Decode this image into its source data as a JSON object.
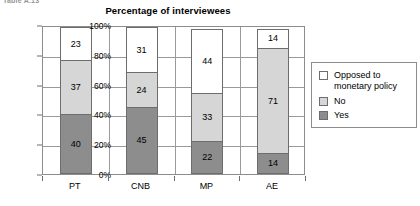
{
  "caption_fragment": "Table A.13",
  "chart_data": {
    "type": "bar",
    "subtype": "stacked-bar-100",
    "title": "Percentage of interviewees",
    "xlabel": "",
    "ylabel": "",
    "ylim": [
      0,
      100
    ],
    "ytick_labels": [
      "0%",
      "20%",
      "40%",
      "60%",
      "80%",
      "100%"
    ],
    "ytick_values": [
      0,
      20,
      40,
      60,
      80,
      100
    ],
    "grid": true,
    "legend_position": "right",
    "categories": [
      "PT",
      "CNB",
      "MP",
      "AE"
    ],
    "series": [
      {
        "name": "Yes",
        "color": "#8d8d8d",
        "values": [
          40,
          45,
          22,
          14
        ]
      },
      {
        "name": "No",
        "color": "#d6d6d6",
        "values": [
          37,
          24,
          33,
          71
        ]
      },
      {
        "name": "Opposed to monetary policy",
        "color": "#ffffff",
        "values": [
          23,
          31,
          44,
          14
        ]
      }
    ],
    "legend_entries": [
      {
        "label": "Opposed to\nmonetary policy",
        "color": "#ffffff"
      },
      {
        "label": "No",
        "color": "#d6d6d6"
      },
      {
        "label": "Yes",
        "color": "#8d8d8d"
      }
    ]
  }
}
